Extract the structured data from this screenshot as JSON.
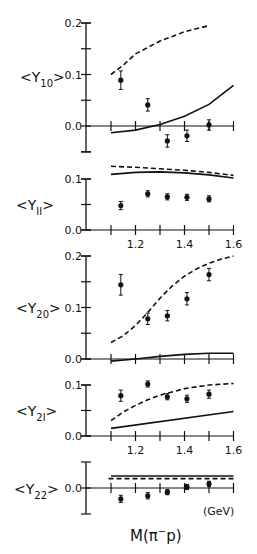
{
  "chart_data": [
    {
      "type": "scatter",
      "title": "",
      "ylabel": "<Y10>",
      "xlabel": "",
      "xlim": [
        1.1,
        1.6
      ],
      "ylim": [
        -0.05,
        0.2
      ],
      "yticks": [
        0.0,
        0.1,
        0.2
      ],
      "ytick_labels": [
        "0.0",
        "0.1",
        "0.2"
      ],
      "minor_yticks": [
        -0.05,
        0.05,
        0.15
      ],
      "x_axis_at": 0.0,
      "x": [
        1.14,
        1.25,
        1.33,
        1.41,
        1.5
      ],
      "series": [
        {
          "name": "data",
          "style": "points",
          "values": [
            0.089,
            0.041,
            -0.029,
            -0.019,
            0.002
          ],
          "errors": [
            0.018,
            0.012,
            0.012,
            0.011,
            0.01
          ]
        },
        {
          "name": "model dashed",
          "style": "dashed",
          "x": [
            1.1,
            1.15,
            1.2,
            1.3,
            1.4,
            1.5
          ],
          "values": [
            0.1,
            0.118,
            0.14,
            0.165,
            0.183,
            0.195
          ]
        },
        {
          "name": "model solid",
          "style": "solid",
          "x": [
            1.1,
            1.2,
            1.3,
            1.4,
            1.5,
            1.6
          ],
          "values": [
            -0.013,
            -0.008,
            0.003,
            0.019,
            0.042,
            0.079
          ]
        }
      ]
    },
    {
      "type": "scatter",
      "ylabel": "<Y11>",
      "xlim": [
        1.1,
        1.6
      ],
      "ylim": [
        0.0,
        0.13
      ],
      "yticks": [
        0.0,
        0.1
      ],
      "ytick_labels": [
        "0.0",
        "0.1"
      ],
      "minor_yticks": [
        0.05
      ],
      "xtick_labels": [
        "1.2",
        "1.4",
        "1.6"
      ],
      "x": [
        1.14,
        1.25,
        1.33,
        1.41,
        1.5
      ],
      "series": [
        {
          "name": "data",
          "style": "points",
          "values": [
            0.048,
            0.071,
            0.065,
            0.064,
            0.061
          ],
          "errors": [
            0.008,
            0.006,
            0.006,
            0.006,
            0.006
          ]
        },
        {
          "name": "model dashed",
          "style": "dashed",
          "x": [
            1.1,
            1.2,
            1.3,
            1.4,
            1.5,
            1.6
          ],
          "values": [
            0.125,
            0.123,
            0.12,
            0.117,
            0.113,
            0.107
          ]
        },
        {
          "name": "model solid",
          "style": "solid",
          "x": [
            1.1,
            1.2,
            1.3,
            1.4,
            1.5,
            1.6
          ],
          "values": [
            0.109,
            0.113,
            0.114,
            0.112,
            0.108,
            0.102
          ]
        }
      ]
    },
    {
      "type": "scatter",
      "ylabel": "<Y20>",
      "xlim": [
        1.1,
        1.6
      ],
      "ylim": [
        0.0,
        0.2
      ],
      "yticks": [
        0.0,
        0.1,
        0.2
      ],
      "ytick_labels": [
        "0.0",
        "0.1",
        "0.2"
      ],
      "minor_yticks": [
        0.05,
        0.15
      ],
      "x": [
        1.14,
        1.25,
        1.33,
        1.41,
        1.5
      ],
      "series": [
        {
          "name": "data",
          "style": "points",
          "values": [
            0.144,
            0.078,
            0.084,
            0.117,
            0.164
          ],
          "errors": [
            0.02,
            0.011,
            0.01,
            0.012,
            0.012
          ]
        },
        {
          "name": "model dashed",
          "style": "dashed",
          "x": [
            1.1,
            1.15,
            1.2,
            1.25,
            1.3,
            1.35,
            1.4,
            1.45,
            1.5,
            1.55,
            1.6
          ],
          "values": [
            0.032,
            0.045,
            0.065,
            0.09,
            0.118,
            0.142,
            0.161,
            0.175,
            0.186,
            0.194,
            0.2
          ]
        },
        {
          "name": "model solid",
          "style": "solid",
          "x": [
            1.1,
            1.2,
            1.3,
            1.4,
            1.5,
            1.6
          ],
          "values": [
            -0.004,
            0.0,
            0.005,
            0.009,
            0.011,
            0.011
          ]
        }
      ]
    },
    {
      "type": "scatter",
      "ylabel": "<Y21>",
      "xlabel": "",
      "xlim": [
        1.1,
        1.6
      ],
      "ylim": [
        0.0,
        0.1
      ],
      "yticks": [
        0.0,
        0.1
      ],
      "ytick_labels": [
        "0.0",
        "0.1"
      ],
      "minor_yticks": [
        0.05
      ],
      "xtick_labels": [
        "1.2",
        "1.4",
        "1.6"
      ],
      "x": [
        1.14,
        1.25,
        1.33,
        1.41,
        1.5
      ],
      "series": [
        {
          "name": "data",
          "style": "points",
          "values": [
            0.079,
            0.102,
            0.077,
            0.073,
            0.082
          ],
          "errors": [
            0.011,
            0.006,
            0.006,
            0.007,
            0.008
          ]
        },
        {
          "name": "model dashed",
          "style": "dashed",
          "x": [
            1.1,
            1.15,
            1.2,
            1.25,
            1.3,
            1.4,
            1.5,
            1.6
          ],
          "values": [
            0.03,
            0.047,
            0.06,
            0.071,
            0.08,
            0.093,
            0.1,
            0.103
          ]
        },
        {
          "name": "model solid",
          "style": "solid",
          "x": [
            1.1,
            1.6
          ],
          "values": [
            0.015,
            0.048
          ]
        }
      ]
    },
    {
      "type": "scatter",
      "ylabel": "<Y22>",
      "xlabel": "M(π⁻p)",
      "xunit": "(GeV)",
      "xlim": [
        1.1,
        1.6
      ],
      "ylim": [
        -0.05,
        0.05
      ],
      "yticks": [
        0.0
      ],
      "ytick_labels": [
        "0.0"
      ],
      "x": [
        1.14,
        1.25,
        1.33,
        1.41,
        1.5
      ],
      "series": [
        {
          "name": "data",
          "style": "points",
          "values": [
            -0.021,
            -0.015,
            -0.008,
            0.002,
            0.008
          ],
          "errors": [
            0.007,
            0.006,
            0.005,
            0.005,
            0.005
          ]
        },
        {
          "name": "model dashed",
          "style": "dashed",
          "x": [
            1.09,
            1.6
          ],
          "values": [
            0.018,
            0.018
          ]
        },
        {
          "name": "model solid",
          "style": "solid",
          "x": [
            1.1,
            1.6
          ],
          "values": [
            0.023,
            0.023
          ]
        }
      ]
    }
  ],
  "labels": {
    "panel1": {
      "Y": "<Y",
      "sub": "10",
      "close": ">"
    },
    "panel2": {
      "Y": "<Y",
      "sub": "II",
      "close": ">"
    },
    "panel3": {
      "Y": "<Y",
      "sub": "20",
      "close": ">"
    },
    "panel4": {
      "Y": "<Y",
      "sub": "2I",
      "close": ">"
    },
    "panel5": {
      "Y": "<Y",
      "sub": "22",
      "close": ">"
    },
    "xtick_labels": [
      "1.2",
      "1.4",
      "1.6"
    ],
    "xaxis_label": "M(π",
    "xaxis_sup": "−",
    "xaxis_label_end": "p)",
    "xunit": "(GeV)"
  }
}
